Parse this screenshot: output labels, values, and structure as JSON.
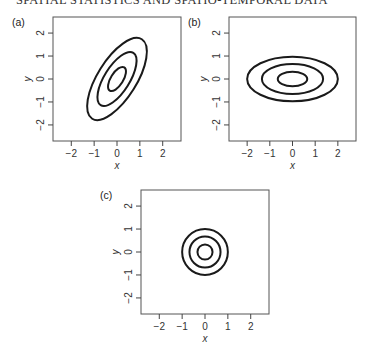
{
  "running_head": "SPATIAL STATISTICS AND SPATIO-TEMPORAL DATA",
  "chart_data": [
    {
      "type": "contour",
      "panel_label": "(a)",
      "title": "",
      "xlabel": "x",
      "ylabel": "y",
      "xlim": [
        -2.8,
        2.8
      ],
      "ylim": [
        -2.7,
        2.7
      ],
      "xticks": [
        -2,
        -1,
        0,
        1,
        2
      ],
      "yticks": [
        -2,
        -1,
        0,
        1,
        2
      ],
      "grid": false,
      "description": "Three concentric contour ellipses of a positively correlated bivariate normal, tilted ~58 degrees from x-axis",
      "center": [
        0,
        0
      ],
      "contours": [
        {
          "semi_major": 0.6,
          "semi_minor": 0.27,
          "angle_deg": 58
        },
        {
          "semi_major": 1.35,
          "semi_minor": 0.55,
          "angle_deg": 58
        },
        {
          "semi_major": 2.05,
          "semi_minor": 0.85,
          "angle_deg": 58
        }
      ]
    },
    {
      "type": "contour",
      "panel_label": "(b)",
      "title": "",
      "xlabel": "x",
      "ylabel": "y",
      "xlim": [
        -2.8,
        2.8
      ],
      "ylim": [
        -2.7,
        2.7
      ],
      "xticks": [
        -2,
        -1,
        0,
        1,
        2
      ],
      "yticks": [
        -2,
        -1,
        0,
        1,
        2
      ],
      "grid": false,
      "description": "Three concentric axis-aligned ellipses elongated along x (anisotropic, uncorrelated)",
      "center": [
        0,
        0
      ],
      "contours": [
        {
          "semi_x": 0.65,
          "semi_y": 0.32
        },
        {
          "semi_x": 1.35,
          "semi_y": 0.65
        },
        {
          "semi_x": 2.0,
          "semi_y": 0.97
        }
      ]
    },
    {
      "type": "contour",
      "panel_label": "(c)",
      "title": "",
      "xlabel": "x",
      "ylabel": "y",
      "xlim": [
        -2.8,
        2.8
      ],
      "ylim": [
        -2.7,
        2.7
      ],
      "xticks": [
        -2,
        -1,
        0,
        1,
        2
      ],
      "yticks": [
        -2,
        -1,
        0,
        1,
        2
      ],
      "grid": false,
      "description": "Three concentric circles (isotropic)",
      "center": [
        0,
        0
      ],
      "contours": [
        {
          "radius": 0.33
        },
        {
          "radius": 0.68
        },
        {
          "radius": 1.0
        }
      ]
    }
  ]
}
